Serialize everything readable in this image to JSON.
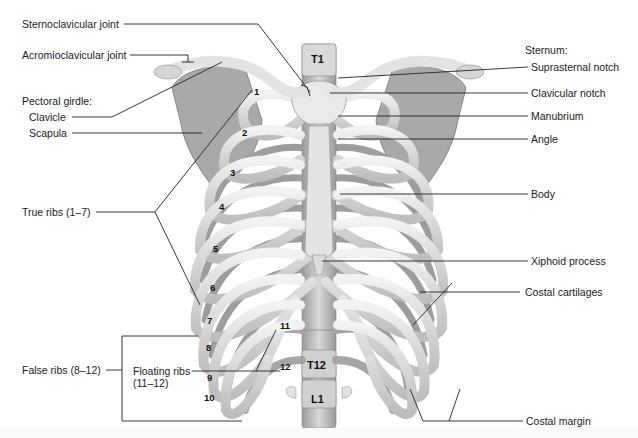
{
  "figure": {
    "colors": {
      "bone_light": "#e6e6e6",
      "bone_mid": "#c9c9c9",
      "bone_dark": "#8f8f8f",
      "leader_line": "#222222",
      "text": "#1a1a1a",
      "background": "#ffffff"
    }
  },
  "labels_left": {
    "sternoclavicular_joint": "Sternoclavicular joint",
    "acromioclavicular_joint": "Acromioclavicular joint",
    "pectoral_girdle_heading": "Pectoral girdle:",
    "clavicle": "Clavicle",
    "scapula": "Scapula",
    "true_ribs": "True ribs (1–7)",
    "false_ribs": "False ribs (8–12)",
    "floating_ribs_line1": "Floating ribs",
    "floating_ribs_line2": "(11–12)"
  },
  "labels_right": {
    "sternum_heading": "Sternum:",
    "suprasternal_notch": "Suprasternal notch",
    "clavicular_notch": "Clavicular notch",
    "manubrium": "Manubrium",
    "angle": "Angle",
    "body": "Body",
    "xiphoid_process": "Xiphoid process",
    "costal_cartilages": "Costal cartilages",
    "costal_margin": "Costal margin"
  },
  "vertebrae": {
    "t1": "T1",
    "t12": "T12",
    "l1": "L1"
  },
  "rib_numbers": [
    "1",
    "2",
    "3",
    "4",
    "5",
    "6",
    "7",
    "8",
    "9",
    "10",
    "11",
    "12"
  ]
}
